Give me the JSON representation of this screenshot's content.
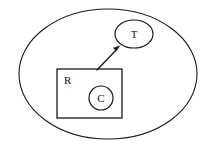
{
  "diagram": {
    "type": "set-containment-diagram",
    "background_color": "#ffffff",
    "stroke_color": "#1a1a1a",
    "nodes": [
      {
        "id": "universe",
        "label": "",
        "shape": "ellipse",
        "role": "outer-boundary",
        "cx": 108,
        "cy": 74,
        "rx": 89,
        "ry": 65,
        "stroke_width": 1.1
      },
      {
        "id": "target",
        "label": "T",
        "shape": "ellipse",
        "role": "target-node",
        "cx": 134,
        "cy": 34,
        "rx": 19,
        "ry": 14,
        "stroke_width": 1.2,
        "label_x": 134,
        "label_y": 35
      },
      {
        "id": "region",
        "label": "R",
        "shape": "rectangle",
        "role": "region-node",
        "x": 57,
        "y": 69,
        "width": 65,
        "height": 49,
        "stroke_width": 1.3,
        "label_x": 64,
        "label_y": 81
      },
      {
        "id": "core",
        "label": "C",
        "shape": "circle",
        "role": "core-node",
        "cx": 101,
        "cy": 98,
        "rx": 12,
        "ry": 12,
        "stroke_width": 1.2,
        "label_x": 101,
        "label_y": 99
      }
    ],
    "edges": [
      {
        "id": "region-to-target",
        "from": "region",
        "to": "target",
        "label": "",
        "arrowhead": "filled-triangle",
        "x1": 97,
        "y1": 70,
        "x2": 119,
        "y2": 47
      }
    ]
  }
}
